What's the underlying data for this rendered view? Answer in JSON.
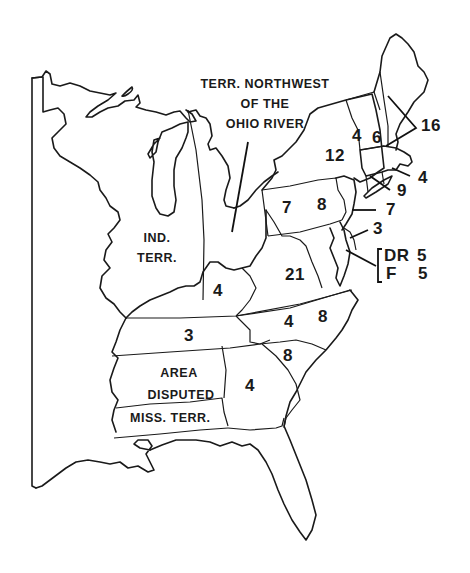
{
  "map": {
    "subject": "Eastern United States electoral votes by state",
    "stroke_color": "#1a1a1a",
    "background": "#ffffff"
  },
  "labels": {
    "nw_territory": [
      "TERR. NORTHWEST",
      "OF THE",
      "OHIO RIVER"
    ],
    "ind_territory": [
      "IND.",
      "TERR."
    ],
    "disputed": [
      "AREA",
      "DISPUTED"
    ],
    "miss_territory": "MISS. TERR."
  },
  "states": [
    {
      "name": "Vermont",
      "votes": "4"
    },
    {
      "name": "New Hampshire",
      "votes": "6"
    },
    {
      "name": "Massachusetts",
      "votes": "16"
    },
    {
      "name": "New York",
      "votes": "12"
    },
    {
      "name": "Rhode Island",
      "votes": "4"
    },
    {
      "name": "Connecticut",
      "votes": "9"
    },
    {
      "name": "New Jersey",
      "votes": "7"
    },
    {
      "name": "Pennsylvania",
      "votes_left": "7",
      "votes_right": "8"
    },
    {
      "name": "Delaware",
      "votes": "3"
    },
    {
      "name": "Maryland",
      "dr_label": "DR",
      "dr_votes": "5",
      "f_label": "F",
      "f_votes": "5"
    },
    {
      "name": "Virginia",
      "votes": "21"
    },
    {
      "name": "Kentucky",
      "votes": "4"
    },
    {
      "name": "Tennessee",
      "votes": "3"
    },
    {
      "name": "North Carolina",
      "votes_left": "4",
      "votes_right": "8"
    },
    {
      "name": "South Carolina",
      "votes": "8"
    },
    {
      "name": "Georgia",
      "votes": "4"
    }
  ]
}
